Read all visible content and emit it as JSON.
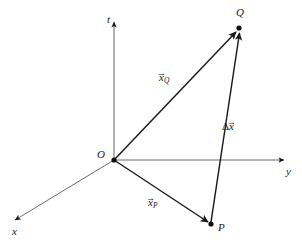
{
  "figure": {
    "kind": "vector-diagram",
    "background_color": "#ffffff",
    "stroke_color": "#1a1a1a"
  },
  "axes": [
    {
      "name": "t-axis",
      "label": "t",
      "label_x": 107,
      "label_y": 14,
      "from": [
        114,
        160
      ],
      "to": [
        114,
        22
      ],
      "arrow": true
    },
    {
      "name": "y-axis",
      "label": "y",
      "label_x": 286,
      "label_y": 166,
      "from": [
        114,
        160
      ],
      "to": [
        285,
        160
      ],
      "arrow": true
    },
    {
      "name": "x-axis",
      "label": "x",
      "label_x": 12,
      "label_y": 226,
      "from": [
        114,
        160
      ],
      "to": [
        13,
        221
      ],
      "arrow": true
    }
  ],
  "points": [
    {
      "name": "origin",
      "label": "O",
      "x": 114,
      "y": 160,
      "label_x": 97,
      "label_y": 149,
      "dot": true
    },
    {
      "name": "point-q",
      "label": "Q",
      "x": 239,
      "y": 28,
      "label_x": 236,
      "label_y": 7,
      "dot": true
    },
    {
      "name": "point-p",
      "label": "P",
      "x": 211,
      "y": 224,
      "label_x": 218,
      "label_y": 222,
      "dot": true
    }
  ],
  "vectors": [
    {
      "name": "vector-x-q",
      "base_symbol": "x",
      "subscript": "Q",
      "prefix": "",
      "label_x": 159,
      "label_y": 72,
      "from": [
        114,
        160
      ],
      "to": [
        237,
        31
      ]
    },
    {
      "name": "vector-x-p",
      "base_symbol": "x",
      "subscript": "P",
      "prefix": "",
      "label_x": 148,
      "label_y": 197,
      "from": [
        114,
        160
      ],
      "to": [
        209,
        223
      ]
    },
    {
      "name": "vector-delta-x",
      "base_symbol": "x",
      "subscript": "",
      "prefix": "Δ",
      "label_x": 222,
      "label_y": 121,
      "from": [
        211,
        222
      ],
      "to": [
        240,
        32
      ]
    }
  ],
  "glyphs": {
    "vector_arrow": "→",
    "delta": "Δ"
  }
}
